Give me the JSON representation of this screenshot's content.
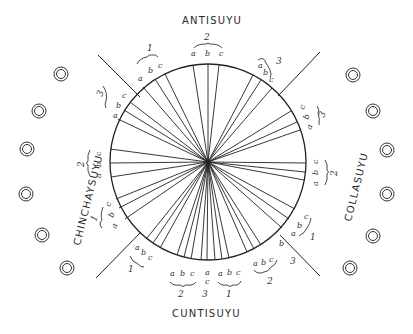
{
  "diagram": {
    "center": [
      208,
      162
    ],
    "radius": 98,
    "stroke_color": "#222222",
    "quarters": [
      {
        "name": "ANTISUYU",
        "position": "top"
      },
      {
        "name": "COLLASUYU",
        "position": "right"
      },
      {
        "name": "CUNTISUYU",
        "position": "bottom"
      },
      {
        "name": "CHINCHAYSUYU",
        "position": "left"
      }
    ],
    "groups": [
      {
        "quarter": "ANTISUYU",
        "number": "1",
        "letters": [
          "a",
          "b",
          "c"
        ]
      },
      {
        "quarter": "ANTISUYU",
        "number": "2",
        "letters": [
          "a",
          "b",
          "c"
        ]
      },
      {
        "quarter": "ANTISUYU",
        "number": "3",
        "letters": [
          "a",
          "b",
          "c"
        ]
      },
      {
        "quarter": "COLLASUYU",
        "number": "3",
        "letters": [
          "a",
          "b",
          "c"
        ]
      },
      {
        "quarter": "COLLASUYU",
        "number": "2",
        "letters": [
          "a",
          "b",
          "c"
        ]
      },
      {
        "quarter": "COLLASUYU",
        "number": "1",
        "letters": [
          "a",
          "b",
          "c"
        ]
      },
      {
        "quarter": "CUNTISUYU",
        "number": "3",
        "letters": [
          "b"
        ]
      },
      {
        "quarter": "CUNTISUYU",
        "number": "2",
        "letters": [
          "a",
          "b",
          "c"
        ]
      },
      {
        "quarter": "CUNTISUYU",
        "number": "1",
        "letters": [
          "a",
          "b",
          "c"
        ]
      },
      {
        "quarter": "CUNTISUYU",
        "number": "3",
        "letters": [
          "a",
          "c"
        ]
      },
      {
        "quarter": "CUNTISUYU",
        "number": "2",
        "letters": [
          "a",
          "b",
          "c"
        ]
      },
      {
        "quarter": "CUNTISUYU",
        "number": "1",
        "letters": [
          "a",
          "b",
          "c"
        ]
      },
      {
        "quarter": "CHINCHAYSUYU",
        "number": "1",
        "letters": [
          "a",
          "b",
          "c"
        ]
      },
      {
        "quarter": "CHINCHAYSUYU",
        "number": "2",
        "letters": [
          "a",
          "b",
          "c"
        ]
      },
      {
        "quarter": "CHINCHAYSUYU",
        "number": "3",
        "letters": [
          "a",
          "b",
          "c"
        ]
      }
    ],
    "labels": {
      "top": "ANTISUYU",
      "right": "COLLASUYU",
      "bottom": "CUNTISUYU",
      "left": "CHINCHAYSUYU",
      "letter_a": "a",
      "letter_b": "b",
      "letter_c": "c",
      "n1": "1",
      "n2": "2",
      "n3": "3"
    },
    "side_markers_left": [
      [
        61,
        74
      ],
      [
        39,
        111
      ],
      [
        27,
        149
      ],
      [
        26,
        194
      ],
      [
        42,
        235
      ],
      [
        67,
        268
      ]
    ],
    "side_markers_right": [
      [
        353,
        75
      ],
      [
        373,
        111
      ],
      [
        387,
        150
      ],
      [
        387,
        194
      ],
      [
        373,
        236
      ],
      [
        350,
        268
      ]
    ]
  }
}
